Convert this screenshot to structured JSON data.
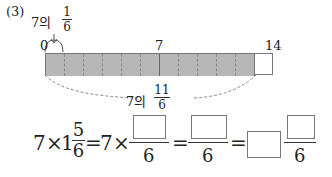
{
  "problem": {
    "number": "(3)",
    "top_label": {
      "prefix": "7의",
      "numerator": "1",
      "denominator": "6"
    },
    "ticks": {
      "start": "0",
      "middle": "7",
      "end": "14"
    },
    "bottom_label": {
      "prefix": "7의",
      "numerator": "11",
      "denominator": "6"
    },
    "bar": {
      "total_segments": 12,
      "shaded_segments": 11,
      "shade_color": "#b7b7b7"
    },
    "equation": {
      "lhs": "7",
      "times1": "×",
      "mixed_whole": "1",
      "mixed_num": "5",
      "mixed_den": "6",
      "eq1": "=",
      "rhs1_whole": "7",
      "times2": "×",
      "den1": "6",
      "eq2": "=",
      "den2": "6",
      "eq3": "=",
      "den3": "6"
    }
  }
}
